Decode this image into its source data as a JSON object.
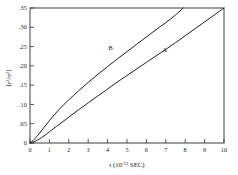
{
  "figure": {
    "background_color": "#ffffff",
    "frame_color": "#2b2b2b",
    "curve_color": "#1f1f1f"
  },
  "chart_data": {
    "type": "line",
    "title": "",
    "subtitle": "",
    "xlabel": "t (10⁻¹³ SEC)",
    "xlabel_base": "t (10",
    "xlabel_exponent": "-13",
    "xlabel_tail": " SEC)",
    "ylabel": "⟨r²/σ²⟩",
    "ylabel_parts": [
      "⟨r",
      "2",
      "/σ",
      "2",
      "⟩"
    ],
    "xlim": [
      0,
      10
    ],
    "ylim": [
      0,
      0.35
    ],
    "grid": false,
    "legend": "inline-labels",
    "legend_position": "on-curve",
    "xticks": [
      0,
      1,
      2,
      3,
      4,
      5,
      6,
      7,
      8,
      9,
      10
    ],
    "xticklabels": [
      "0",
      "1",
      "2",
      "3",
      "4",
      "5",
      "6",
      "7",
      "8",
      "9",
      "10"
    ],
    "yticks": [
      0,
      0.05,
      0.1,
      0.15,
      0.2,
      0.25,
      0.3,
      0.35
    ],
    "yticklabels": [
      "0",
      ".05",
      ".10",
      ".15",
      ".20",
      ".25",
      ".30",
      ".35"
    ],
    "series": [
      {
        "name": "B",
        "label": "B",
        "label_x": 4.15,
        "label_y": 0.241,
        "x": [
          0.0,
          0.15,
          0.3,
          0.5,
          0.75,
          1.0,
          1.25,
          1.5,
          1.75,
          2.0,
          2.5,
          3.0,
          3.5,
          4.0,
          4.5,
          5.0,
          5.5,
          6.0,
          6.5,
          7.0,
          7.5,
          7.9
        ],
        "y": [
          0.0,
          0.006,
          0.014,
          0.026,
          0.042,
          0.058,
          0.073,
          0.087,
          0.1,
          0.112,
          0.135,
          0.157,
          0.178,
          0.198,
          0.218,
          0.237,
          0.256,
          0.275,
          0.294,
          0.312,
          0.332,
          0.35
        ]
      },
      {
        "name": "A",
        "label": "A",
        "label_x": 6.95,
        "label_y": 0.236,
        "x": [
          0.0,
          0.2,
          0.4,
          0.6,
          0.8,
          1.0,
          1.5,
          2.0,
          2.5,
          3.0,
          3.5,
          4.0,
          4.5,
          5.0,
          5.5,
          6.0,
          6.5,
          7.0,
          7.5,
          8.0,
          8.5,
          9.0,
          9.5,
          10.0
        ],
        "y": [
          0.0,
          0.003,
          0.008,
          0.014,
          0.021,
          0.029,
          0.048,
          0.067,
          0.086,
          0.104,
          0.122,
          0.14,
          0.158,
          0.175,
          0.192,
          0.209,
          0.226,
          0.243,
          0.26,
          0.278,
          0.296,
          0.314,
          0.332,
          0.35
        ]
      }
    ]
  }
}
